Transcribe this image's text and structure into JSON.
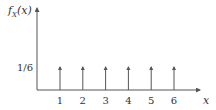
{
  "chart_data": {
    "type": "stem",
    "title": "",
    "ylabel": "f_X(x)",
    "ylabel_main": "f",
    "ylabel_sub": "X",
    "ylabel_arg": "(x)",
    "xlabel": "x",
    "categories": [
      "1",
      "2",
      "3",
      "4",
      "5",
      "6"
    ],
    "x": [
      1,
      2,
      3,
      4,
      5,
      6
    ],
    "values": [
      0.1667,
      0.1667,
      0.1667,
      0.1667,
      0.1667,
      0.1667
    ],
    "y_tick_labels": [
      "1/6"
    ],
    "y_tick_values": [
      0.1667
    ],
    "xlim": [
      0,
      7
    ],
    "grid": false,
    "legend": "none"
  },
  "colors": {
    "axis": "#555555",
    "stem": "#555555",
    "text": "#333333"
  }
}
